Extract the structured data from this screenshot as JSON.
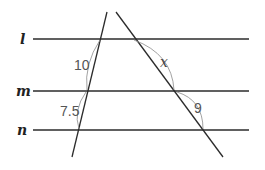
{
  "diagram": {
    "type": "parallel lines cut by two transversals",
    "parallel_lines": [
      {
        "name": "l",
        "y": 39
      },
      {
        "name": "m",
        "y": 91
      },
      {
        "name": "n",
        "y": 130
      }
    ],
    "segment_labels": {
      "left_upper": "10",
      "left_lower": "7.5",
      "right_upper": "x",
      "right_lower": "9"
    },
    "colors": {
      "line": "#2b2b2b",
      "arc": "#8a8a8a",
      "text": "#555555"
    }
  }
}
